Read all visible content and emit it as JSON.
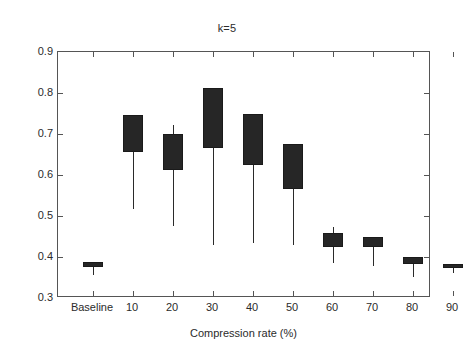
{
  "chart_data": {
    "type": "box",
    "title": "k=5",
    "xlabel": "Compression rate (%)",
    "ylabel": "",
    "ylim": [
      0.3,
      0.9
    ],
    "ytick_labels": [
      "0.9",
      "0.8",
      "0.7",
      "0.6",
      "0.5",
      "0.4",
      "0.3"
    ],
    "yticks": [
      0.9,
      0.8,
      0.7,
      0.6,
      0.5,
      0.4,
      0.3
    ],
    "grid": false,
    "legend": null,
    "categories": [
      "Baseline",
      "10",
      "20",
      "30",
      "40",
      "50",
      "60",
      "70",
      "80",
      "90"
    ],
    "boxes": [
      {
        "category": "Baseline",
        "whisker_low": 0.355,
        "q1": 0.375,
        "median": 0.381,
        "q3": 0.388,
        "whisker_high": 0.388
      },
      {
        "category": "10",
        "whisker_low": 0.518,
        "q1": 0.655,
        "median": 0.7,
        "q3": 0.747,
        "whisker_high": 0.747
      },
      {
        "category": "20",
        "whisker_low": 0.476,
        "q1": 0.613,
        "median": 0.657,
        "q3": 0.7,
        "whisker_high": 0.723
      },
      {
        "category": "30",
        "whisker_low": 0.43,
        "q1": 0.665,
        "median": 0.74,
        "q3": 0.813,
        "whisker_high": 0.813
      },
      {
        "category": "40",
        "whisker_low": 0.434,
        "q1": 0.624,
        "median": 0.688,
        "q3": 0.75,
        "whisker_high": 0.75
      },
      {
        "category": "50",
        "whisker_low": 0.43,
        "q1": 0.566,
        "median": 0.62,
        "q3": 0.675,
        "whisker_high": 0.675
      },
      {
        "category": "60",
        "whisker_low": 0.386,
        "q1": 0.425,
        "median": 0.44,
        "q3": 0.458,
        "whisker_high": 0.474
      },
      {
        "category": "70",
        "whisker_low": 0.377,
        "q1": 0.424,
        "median": 0.435,
        "q3": 0.448,
        "whisker_high": 0.448
      },
      {
        "category": "80",
        "whisker_low": 0.352,
        "q1": 0.384,
        "median": 0.392,
        "q3": 0.4,
        "whisker_high": 0.4
      },
      {
        "category": "90",
        "whisker_low": 0.361,
        "q1": 0.372,
        "median": 0.377,
        "q3": 0.383,
        "whisker_high": 0.383
      }
    ]
  },
  "colors": {
    "box_fill": "#262626",
    "box_edge": "#1a1a1a",
    "whisker": "#2a2a2a",
    "axis": "#555555",
    "text": "#2b2b2b",
    "background": "#ffffff"
  }
}
